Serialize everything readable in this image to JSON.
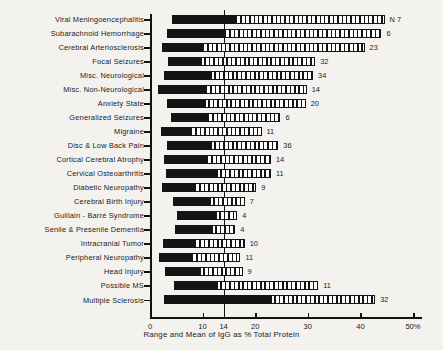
{
  "chart_data": {
    "type": "bar",
    "title": "",
    "xlabel": "Range and Mean of IgG as % Total Protein",
    "ylabel": "",
    "xlim": [
      0,
      50
    ],
    "grid": false,
    "legend_position": "none",
    "reference_line": {
      "value": 14,
      "label": "14"
    },
    "xticks": [
      0,
      10,
      14,
      20,
      30,
      40,
      50
    ],
    "xticklabels": [
      "0",
      "10",
      "14",
      "20",
      "30",
      "40",
      "50%"
    ],
    "n_header": "N",
    "categories": [
      "Viral Meningoencephalitis",
      "Subarachnoid Hemorrhage",
      "Cerebral Arteriosclerosis",
      "Focal Seizures",
      "Misc. Neurological",
      "Misc. Non-Neurological",
      "Anxiety State",
      "Generalized Seizures",
      "Migraine",
      "Disc & Low Back Pain",
      "Cortical Cerebral Atrophy",
      "Cervical Osteoarthritis",
      "Diabetic Neuropathy",
      "Cerebral Birth Injury",
      "Guillain - Barré Syndrome",
      "Senile & Presenile Dementia",
      "Intracranial Tumor",
      "Peripheral Neuropathy",
      "Head Injury",
      "Possible MS",
      "Multiple Sclerosis"
    ],
    "series": [
      {
        "name": "range_min",
        "values": [
          4.2,
          3.2,
          2.3,
          3.4,
          2.6,
          1.6,
          3.3,
          4.0,
          2.0,
          3.2,
          2.6,
          3.1,
          2.3,
          4.4,
          5.2,
          4.8,
          2.4,
          1.8,
          2.8,
          4.6,
          2.6
        ]
      },
      {
        "name": "mean",
        "values": [
          16.2,
          14.0,
          9.9,
          9.4,
          11.2,
          10.4,
          10.0,
          10.8,
          7.6,
          11.3,
          10.6,
          12.4,
          8.4,
          11.0,
          12.1,
          11.4,
          8.4,
          7.8,
          9.2,
          12.4,
          22.6
        ]
      },
      {
        "name": "range_max",
        "values": [
          44.6,
          44.0,
          40.8,
          31.4,
          31.0,
          29.8,
          29.6,
          24.8,
          21.2,
          24.4,
          23.0,
          23.0,
          20.2,
          18.0,
          16.6,
          16.2,
          18.0,
          17.2,
          17.6,
          32.0,
          42.8
        ]
      }
    ],
    "n_values": [
      "7",
      "6",
      "23",
      "32",
      "34",
      "14",
      "20",
      "6",
      "11",
      "36",
      "14",
      "11",
      "9",
      "7",
      "4",
      "4",
      "10",
      "11",
      "9",
      "11",
      "32"
    ]
  }
}
